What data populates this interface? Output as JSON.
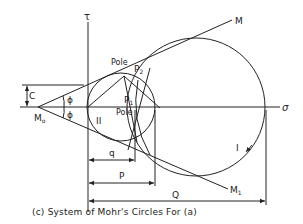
{
  "figure": {
    "caption": "(c) System of Mohr's Circles For (a)",
    "axes": {
      "tau_label": "τ",
      "sigma_label": "σ"
    },
    "labels": {
      "M": "M",
      "M1": "M",
      "M1_sub": "1",
      "M0": "M",
      "M0_sub": "o",
      "C": "C",
      "phi_upper": "ϕ",
      "phi_lower": "ϕ",
      "pole_upper": "Pole",
      "pole_lower": "Pole",
      "P2": "P",
      "P2_sub": "2",
      "P1": "P",
      "P1_sub": "1",
      "circle_I": "I",
      "circle_II": "II",
      "dim_q": "q",
      "dim_P": "P",
      "dim_Q": "Q"
    },
    "colors": {
      "ink": "#222222",
      "background": "#ffffff"
    }
  }
}
